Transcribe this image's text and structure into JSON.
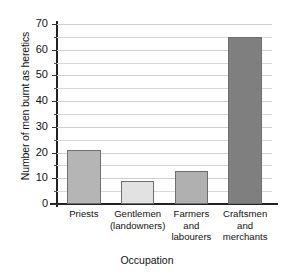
{
  "chart_data": {
    "type": "bar",
    "title": "",
    "xlabel": "Occupation",
    "ylabel": "Number of men burnt as heretics",
    "categories": [
      "Priests",
      "Gentlemen (landowners)",
      "Farmers and labourers",
      "Craftsmen and merchants"
    ],
    "category_lines": [
      [
        "Priests"
      ],
      [
        "Gentlemen",
        "(landowners)"
      ],
      [
        "Farmers",
        "and",
        "labourers"
      ],
      [
        "Craftsmen",
        "and",
        "merchants"
      ]
    ],
    "values": [
      21,
      9,
      13,
      65
    ],
    "bar_colors": [
      "#b5b5b5",
      "#e2e2e2",
      "#b0b0b0",
      "#7f7f7f"
    ],
    "bar_border_color": "#6e6e6e",
    "ylim": [
      0,
      70
    ],
    "ytick_step": 10,
    "yminor_step": 5,
    "yticks": [
      0,
      10,
      20,
      30,
      40,
      50,
      60,
      70
    ],
    "ytick_labels": [
      "0",
      "10",
      "20",
      "30",
      "40",
      "50",
      "60",
      "70"
    ],
    "grid": true,
    "gridline_color": "#d8d8d8",
    "axis_color": "#222222",
    "legend": null,
    "legend_position": "none"
  }
}
